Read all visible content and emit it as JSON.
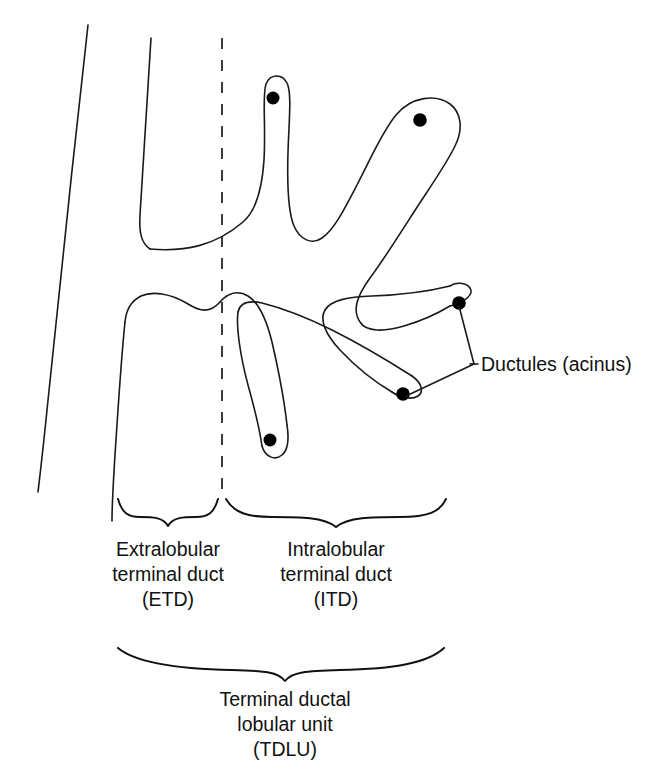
{
  "diagram": {
    "background_color": "#ffffff",
    "line_color": "#1a1a1a",
    "dot_color": "#000000",
    "callouts": [
      {
        "id": "ductules",
        "label": "Ductules (acinus)",
        "x": 478,
        "y": 370
      }
    ],
    "brace_labels": [
      {
        "id": "etd",
        "lines": [
          "Extralobular",
          "terminal duct",
          "(ETD)"
        ],
        "line1": "Extralobular",
        "line2": "terminal duct",
        "line3": "(ETD)",
        "center_x": 168,
        "brace_from": 118,
        "brace_to": 218
      },
      {
        "id": "itd",
        "lines": [
          "Intralobular",
          "terminal duct",
          "(ITD)"
        ],
        "line1": "Intralobular",
        "line2": "terminal duct",
        "line3": "(ITD)",
        "center_x": 336,
        "brace_from": 226,
        "brace_to": 446
      },
      {
        "id": "tdlu",
        "lines": [
          "Terminal ductal",
          "lobular unit",
          "(TDLU)"
        ],
        "line1": "Terminal ductal",
        "line2": "lobular unit",
        "line3": "(TDLU)",
        "center_x": 285,
        "brace_from": 118,
        "brace_to": 444
      }
    ],
    "acini": [
      {
        "id": "acinus-1",
        "cx": 273,
        "cy": 98,
        "r": 6.5
      },
      {
        "id": "acinus-2",
        "cx": 420,
        "cy": 120,
        "r": 6.8
      },
      {
        "id": "acinus-3",
        "cx": 459,
        "cy": 303,
        "r": 6.8
      },
      {
        "id": "acinus-4",
        "cx": 403,
        "cy": 394,
        "r": 6.8
      },
      {
        "id": "acinus-5",
        "cx": 270,
        "cy": 440,
        "r": 6.5
      }
    ],
    "structures": {
      "major_duct_label": "major duct wall",
      "lobule_label": "lobule outline",
      "divider_label": "lobule boundary (dashed)"
    }
  }
}
